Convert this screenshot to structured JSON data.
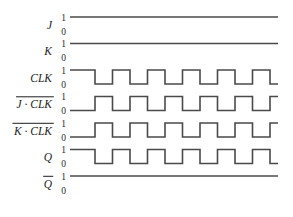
{
  "figure": {
    "background_color": "#ffffff",
    "wave_color": "#4a4a4a",
    "text_color": "#1d1d1d"
  },
  "axis": {
    "level_high": "1",
    "level_low": "0",
    "x_start": 70,
    "x_end": 278,
    "row_pitch": 26.5,
    "first_row_high_y": 17,
    "row_height": 14
  },
  "clock": {
    "period_px": 35,
    "duty": 0.5,
    "cycles": 6,
    "first_edge_x": 95
  },
  "chart_data": {
    "type": "line",
    "xlabel": "",
    "ylabel": "",
    "ylim": [
      0,
      1
    ],
    "grid": false,
    "legend": "none",
    "x_unit": "clock period = 35 px",
    "series": [
      {
        "name": "J",
        "label": "J",
        "overline": false,
        "label_parts": [
          {
            "text": "J",
            "bar": false
          }
        ],
        "initial": 1,
        "constant": true,
        "transitions": [],
        "values": [
          1,
          1,
          1,
          1,
          1,
          1,
          1,
          1,
          1,
          1,
          1,
          1,
          1
        ]
      },
      {
        "name": "K",
        "label": "K",
        "overline": false,
        "label_parts": [
          {
            "text": "K",
            "bar": false
          }
        ],
        "initial": 1,
        "constant": true,
        "transitions": [],
        "values": [
          1,
          1,
          1,
          1,
          1,
          1,
          1,
          1,
          1,
          1,
          1,
          1,
          1
        ]
      },
      {
        "name": "CLK",
        "label": "CLK",
        "overline": false,
        "label_parts": [
          {
            "text": "CLK",
            "bar": false
          }
        ],
        "initial": 1,
        "constant": false,
        "phase": 0,
        "transitions": [
          95,
          112.5,
          130,
          147.5,
          165,
          182.5,
          200,
          217.5,
          235,
          252.5,
          270
        ],
        "values": [
          1,
          0,
          1,
          0,
          1,
          0,
          1,
          0,
          1,
          0,
          1,
          0,
          1
        ]
      },
      {
        "name": "J_bar_CLK",
        "label": "J · CLK",
        "overline": true,
        "label_parts": [
          {
            "text": "J",
            "bar": true
          },
          {
            "text": " · ",
            "bar": true
          },
          {
            "text": "CLK",
            "bar": true
          }
        ],
        "initial": 0,
        "constant": false,
        "phase": 1,
        "transitions": [
          95,
          112.5,
          130,
          147.5,
          165,
          182.5,
          200,
          217.5,
          235,
          252.5,
          270
        ],
        "values": [
          0,
          1,
          0,
          1,
          0,
          1,
          0,
          1,
          0,
          1,
          0,
          1,
          0
        ]
      },
      {
        "name": "K_bar_CLK",
        "label": "K · CLK",
        "overline": true,
        "label_parts": [
          {
            "text": "K",
            "bar": true
          },
          {
            "text": " · ",
            "bar": true
          },
          {
            "text": "CLK",
            "bar": true
          }
        ],
        "initial": 0,
        "constant": false,
        "phase": 1,
        "transitions": [
          95,
          112.5,
          130,
          147.5,
          165,
          182.5,
          200,
          217.5,
          235,
          252.5,
          270
        ],
        "values": [
          0,
          1,
          0,
          1,
          0,
          1,
          0,
          1,
          0,
          1,
          0,
          1,
          0
        ]
      },
      {
        "name": "Q",
        "label": "Q",
        "overline": false,
        "label_parts": [
          {
            "text": "Q",
            "bar": false
          }
        ],
        "initial": 1,
        "constant": false,
        "phase": 0,
        "transitions": [
          95,
          112.5,
          130,
          147.5,
          165,
          182.5,
          200,
          217.5,
          235,
          252.5,
          270
        ],
        "values": [
          1,
          0,
          1,
          0,
          1,
          0,
          1,
          0,
          1,
          0,
          1,
          0,
          1
        ]
      },
      {
        "name": "Q_bar",
        "label": "Q",
        "overline": true,
        "label_parts": [
          {
            "text": "Q",
            "bar": true
          }
        ],
        "initial": 1,
        "constant": true,
        "transitions": [],
        "values": [
          1,
          1,
          1,
          1,
          1,
          1,
          1,
          1,
          1,
          1,
          1,
          1,
          1
        ]
      }
    ]
  }
}
